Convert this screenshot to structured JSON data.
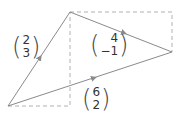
{
  "diagram": {
    "colors": {
      "line": "#8a8a8a",
      "dash": "#b0b0b0",
      "text": "#333333"
    },
    "points": {
      "origin": [
        8,
        106
      ],
      "top": [
        70,
        12
      ],
      "right": [
        172,
        52
      ]
    },
    "vectors": [
      {
        "id": "a",
        "label_top": "2",
        "label_bottom": "3"
      },
      {
        "id": "b",
        "label_top": "4",
        "label_bottom": "−1"
      },
      {
        "id": "c",
        "label_top": "6",
        "label_bottom": "2"
      }
    ]
  }
}
